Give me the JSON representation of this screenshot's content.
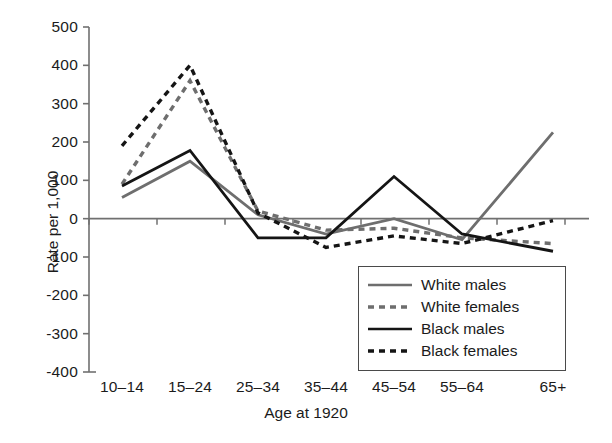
{
  "chart_data": {
    "type": "line",
    "title": "",
    "subtitle": "",
    "xlabel": "Age at 1920",
    "ylabel": "Rate per 1,000",
    "categories": [
      "10–14",
      "15–24",
      "25–34",
      "35–44",
      "45–54",
      "55–64",
      "65+"
    ],
    "ylim": [
      -400,
      500
    ],
    "yticks": [
      500,
      400,
      300,
      200,
      100,
      0,
      -100,
      -200,
      -300,
      -400
    ],
    "ytick_labels": [
      "500",
      "400",
      "300",
      "200",
      "100",
      "0",
      "-100",
      "-200",
      "-300",
      "-400"
    ],
    "grid": false,
    "legend_position": "lower right",
    "zero_line": true,
    "series": [
      {
        "name": "White males",
        "color": "#6e6e6e",
        "style": "solid",
        "values": [
          55,
          150,
          10,
          -40,
          0,
          -55,
          225
        ]
      },
      {
        "name": "White females",
        "color": "#6e6e6e",
        "style": "dashed",
        "values": [
          90,
          360,
          20,
          -30,
          -25,
          -50,
          -65
        ]
      },
      {
        "name": "Black males",
        "color": "#151515",
        "style": "solid",
        "values": [
          85,
          178,
          -50,
          -50,
          110,
          -40,
          -85
        ]
      },
      {
        "name": "Black females",
        "color": "#151515",
        "style": "dashed",
        "values": [
          190,
          400,
          15,
          -75,
          -45,
          -65,
          -5
        ]
      }
    ]
  },
  "legend": {
    "items": [
      {
        "label": "White males"
      },
      {
        "label": "White females"
      },
      {
        "label": "Black males"
      },
      {
        "label": "Black females"
      }
    ]
  }
}
